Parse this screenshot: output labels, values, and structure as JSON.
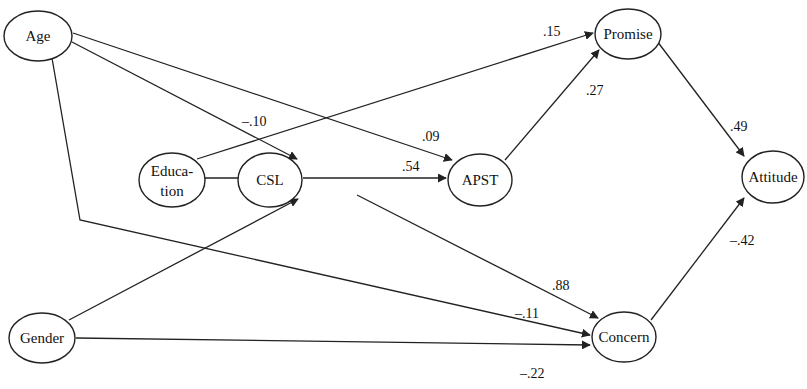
{
  "diagram": {
    "type": "path-diagram",
    "nodes": [
      {
        "id": "age",
        "label": "Age"
      },
      {
        "id": "education",
        "label": "Education",
        "label_line1": "Educa-",
        "label_line2": "tion"
      },
      {
        "id": "gender",
        "label": "Gender"
      },
      {
        "id": "csl",
        "label": "CSL"
      },
      {
        "id": "apst",
        "label": "APST"
      },
      {
        "id": "promise",
        "label": "Promise"
      },
      {
        "id": "concern",
        "label": "Concern"
      },
      {
        "id": "attitude",
        "label": "Attitude"
      }
    ],
    "edges": [
      {
        "from": "Age",
        "to": "CSL",
        "coefficient": "–.10"
      },
      {
        "from": "Age",
        "to": "APST",
        "coefficient": ".09"
      },
      {
        "from": "Age",
        "to": "Concern",
        "coefficient": "–.11"
      },
      {
        "from": "Education",
        "to": "CSL",
        "coefficient": ".73"
      },
      {
        "from": "Education",
        "to": "Promise",
        "coefficient": ".15"
      },
      {
        "from": "Gender",
        "to": "CSL",
        "coefficient": "–.28"
      },
      {
        "from": "Gender",
        "to": "Concern",
        "coefficient": "–.22"
      },
      {
        "from": "CSL",
        "to": "APST",
        "coefficient": ".54"
      },
      {
        "from": "CSL",
        "to": "Concern",
        "coefficient": ".88"
      },
      {
        "from": "APST",
        "to": "Promise",
        "coefficient": ".27"
      },
      {
        "from": "Promise",
        "to": "Attitude",
        "coefficient": ".49"
      },
      {
        "from": "Concern",
        "to": "Attitude",
        "coefficient": "–.42"
      }
    ]
  },
  "labels": {
    "age": "Age",
    "education_1": "Educa-",
    "education_2": "tion",
    "gender": "Gender",
    "csl": "CSL",
    "apst": "APST",
    "promise": "Promise",
    "concern": "Concern",
    "attitude": "Attitude"
  },
  "coefficients": {
    "age_csl": "–.10",
    "age_apst": ".09",
    "age_concern": "–.11",
    "education_csl": ".73",
    "education_promise": ".15",
    "gender_csl": "–.28",
    "gender_concern": "–.22",
    "csl_apst": ".54",
    "csl_concern": ".88",
    "apst_promise": ".27",
    "promise_attitude": ".49",
    "concern_attitude": "–.42"
  }
}
